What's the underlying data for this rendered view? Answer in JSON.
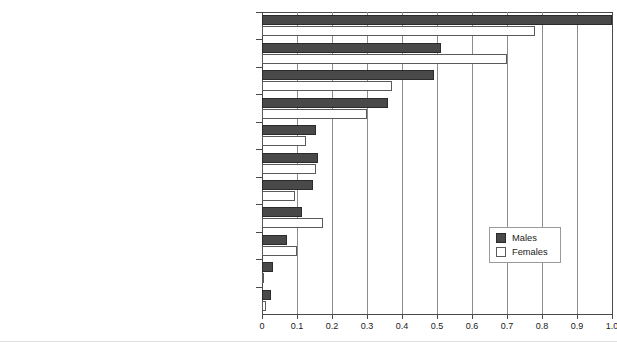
{
  "chart_data": {
    "type": "bar",
    "orientation": "horizontal",
    "title": "",
    "subtitle": "",
    "xlabel": "",
    "ylabel": "",
    "xlim": [
      0,
      1.0
    ],
    "xticks": [
      "0",
      "0.1",
      "0.2",
      "0.3",
      "0.4",
      "0.5",
      "0.6",
      "0.7",
      "0.8",
      "0.9",
      "1.0"
    ],
    "xtick_values": [
      0,
      0.1,
      0.2,
      0.3,
      0.4,
      0.5,
      0.6,
      0.7,
      0.8,
      0.9,
      1.0
    ],
    "grid": true,
    "grid_axis": "x",
    "legend_position": "lower-right-inside",
    "categories": [
      "Joint, muscle or bone issue, mainly affecting the back",
      "Joint, muscle or bone issue, mainly\naffecting neck, shoulders and arms",
      "Depression, stress or anxiety",
      "Joint, muscle or bone issue, mainly affecting hips, legs or feet",
      "Lung or breathing problem",
      "Other issues",
      "Heart disease or infarction, or other circulatory system issues",
      "Eyestrain and/or headache",
      "Infectious disease (bacteria, virus or other type of infection)",
      "Hearing problem",
      "Skin problem"
    ],
    "series": [
      {
        "name": "Males",
        "color": "#494949",
        "values": [
          1.0,
          0.51,
          0.49,
          0.36,
          0.155,
          0.16,
          0.145,
          0.115,
          0.07,
          0.03,
          0.025
        ]
      },
      {
        "name": "Females",
        "color": "#ffffff",
        "values": [
          0.78,
          0.7,
          0.37,
          0.3,
          0.125,
          0.155,
          0.095,
          0.175,
          0.1,
          0.005,
          0.012
        ]
      }
    ]
  },
  "legend": {
    "entries": [
      {
        "label": "Males"
      },
      {
        "label": "Females"
      }
    ]
  }
}
